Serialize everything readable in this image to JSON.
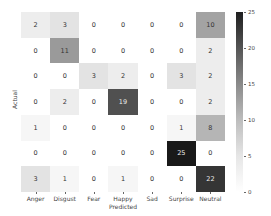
{
  "chart_data": {
    "type": "heatmap",
    "title": "",
    "xlabel": "Predicted",
    "ylabel": "Actual",
    "x_categories": [
      "Anger",
      "Disgust",
      "Fear",
      "Happy",
      "Sad",
      "Surprise",
      "Neutral"
    ],
    "y_categories": [
      "",
      "",
      "",
      "",
      "",
      "",
      ""
    ],
    "matrix": [
      [
        2,
        3,
        0,
        0,
        0,
        0,
        10
      ],
      [
        0,
        11,
        0,
        0,
        0,
        0,
        2
      ],
      [
        0,
        0,
        3,
        2,
        0,
        3,
        2
      ],
      [
        0,
        2,
        0,
        19,
        0,
        0,
        2
      ],
      [
        1,
        0,
        0,
        0,
        0,
        1,
        8
      ],
      [
        0,
        0,
        0,
        0,
        0,
        25,
        0
      ],
      [
        3,
        1,
        0,
        1,
        0,
        0,
        22
      ]
    ],
    "colorbar": {
      "min": 0,
      "max": 25,
      "ticks": [
        0,
        5,
        10,
        15,
        20,
        25
      ],
      "colormap": "Greys"
    },
    "grid": false,
    "legend_position": "right (colorbar)"
  },
  "colors": {
    "low": "#ffffff",
    "high": "#1a1a1a",
    "text_dark": "#333333",
    "text_light": "#eeeeee"
  }
}
